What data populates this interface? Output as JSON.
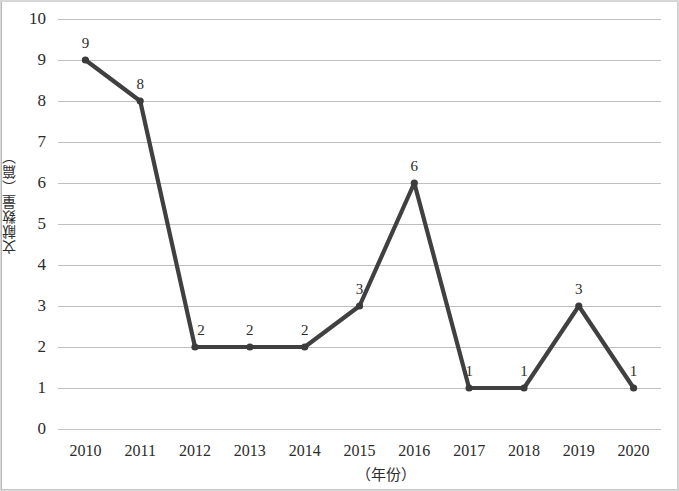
{
  "chart_data": {
    "type": "line",
    "title": "",
    "xlabel": "（年份）",
    "ylabel": "文献数量（篇）",
    "categories": [
      "2010",
      "2011",
      "2012",
      "2013",
      "2014",
      "2015",
      "2016",
      "2017",
      "2018",
      "2019",
      "2020"
    ],
    "values": [
      9,
      8,
      2,
      2,
      2,
      3,
      6,
      1,
      1,
      3,
      1
    ],
    "data_labels": [
      "9",
      "8",
      "2",
      "2",
      "2",
      "3",
      "6",
      "1",
      "1",
      "3",
      "1"
    ],
    "yticks": [
      "0",
      "1",
      "2",
      "3",
      "4",
      "5",
      "6",
      "7",
      "8",
      "9",
      "10"
    ],
    "ylim": [
      0,
      10
    ],
    "ytick_step": 1,
    "grid": true,
    "grid_axis": "y",
    "legend": null,
    "legend_position": "none",
    "series_color": "#404040",
    "marker": "circle",
    "marker_color": "#3b3b3b",
    "grid_color": "#bfbfbf",
    "background_color": "#ffffff",
    "text_color": "#2b2b2b"
  }
}
